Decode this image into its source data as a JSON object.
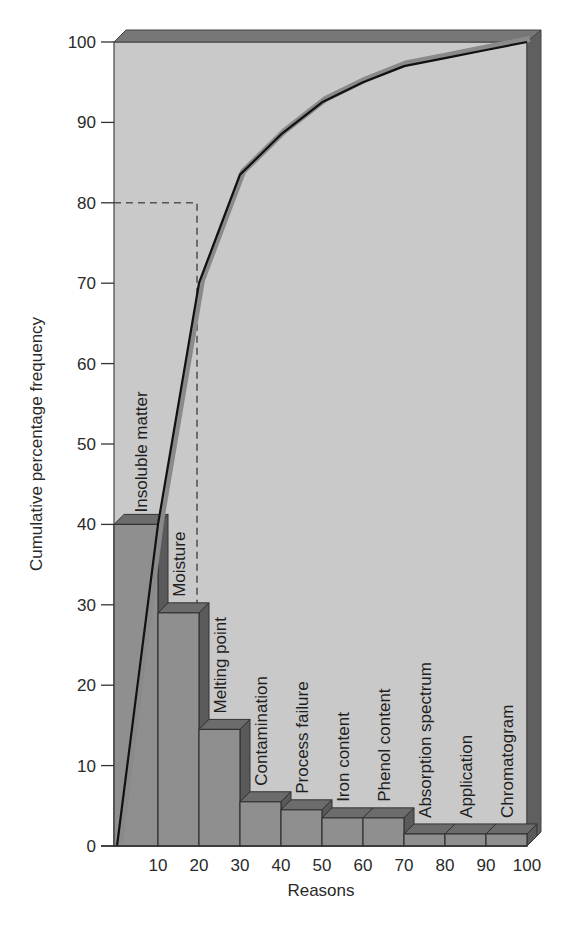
{
  "chart_data": {
    "type": "bar",
    "subtype": "pareto",
    "title": "",
    "xlabel": "Reasons",
    "ylabel": "Cumulative percentage frequency",
    "ylim": [
      0,
      100
    ],
    "xlim": [
      0,
      100
    ],
    "y_ticks": [
      0,
      10,
      20,
      30,
      40,
      50,
      60,
      70,
      80,
      90,
      100
    ],
    "x_ticks": [
      10,
      20,
      30,
      40,
      50,
      60,
      70,
      80,
      90,
      100
    ],
    "grid": false,
    "legend": null,
    "categories": [
      "Insoluble matter",
      "Moisture",
      "Melting point",
      "Contamination",
      "Process failure",
      "Iron content",
      "Phenol content",
      "Absorption spectrum",
      "Application",
      "Chromatogram"
    ],
    "series": [
      {
        "name": "Percentage frequency (bars)",
        "type": "bar",
        "values": [
          40,
          29,
          14.5,
          5.5,
          4.5,
          3.5,
          3.5,
          1.5,
          1.5,
          1.5
        ]
      },
      {
        "name": "Cumulative percentage (line)",
        "type": "line",
        "x": [
          0,
          10,
          20,
          30,
          40,
          50,
          60,
          70,
          80,
          90,
          100
        ],
        "values": [
          0,
          40,
          70,
          83.5,
          88.5,
          92.5,
          95,
          97,
          98,
          99,
          100
        ]
      }
    ],
    "annotations": [
      {
        "type": "dashed-reference",
        "description": "80% cumulative threshold reached at ~20 on Reasons axis",
        "y": 80,
        "x": 20
      }
    ]
  },
  "axis": {
    "y_title": "Cumulative percentage frequency",
    "x_title": "Reasons",
    "y_tick_labels": [
      "0",
      "10",
      "20",
      "30",
      "40",
      "50",
      "60",
      "70",
      "80",
      "90",
      "100"
    ],
    "x_tick_labels": [
      "10",
      "20",
      "30",
      "40",
      "50",
      "60",
      "70",
      "80",
      "90",
      "100"
    ]
  },
  "bars": [
    {
      "label": "Insoluble matter",
      "value": 40
    },
    {
      "label": "Moisture",
      "value": 29
    },
    {
      "label": "Melting point",
      "value": 14.5
    },
    {
      "label": "Contamination",
      "value": 5.5
    },
    {
      "label": "Process failure",
      "value": 4.5
    },
    {
      "label": "Iron content",
      "value": 3.5
    },
    {
      "label": "Phenol content",
      "value": 3.5
    },
    {
      "label": "Absorption spectrum",
      "value": 1.5
    },
    {
      "label": "Application",
      "value": 1.5
    },
    {
      "label": "Chromatogram",
      "value": 1.5
    }
  ],
  "colors": {
    "plot_bg": "#c9c9c9",
    "frame_dark": "#5f5f5f",
    "frame_top": "#777777",
    "bar_front": "#8f8f8f",
    "bar_top": "#6c6c6c",
    "bar_side": "#5a5a5a",
    "line_dark": "#111111",
    "line_halo": "#8a8a8a",
    "dashed": "#555555"
  }
}
